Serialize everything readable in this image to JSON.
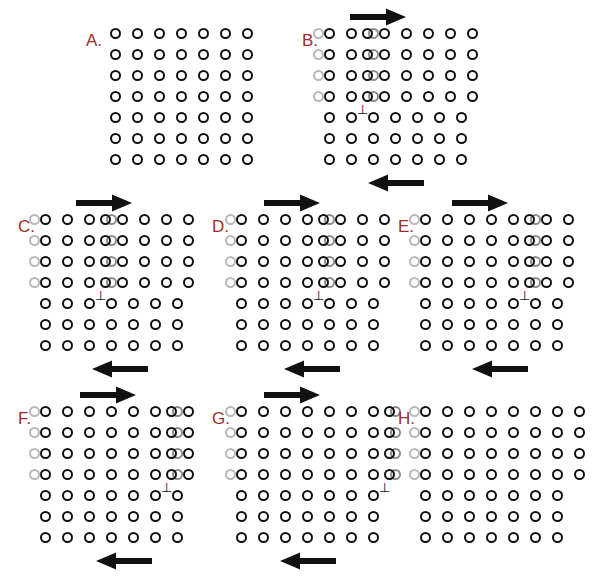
{
  "figure": {
    "background_color": "#ffffff",
    "label_color": "#9c2f26",
    "atom_color": "#111111",
    "ghost_color": "#b8b8b8",
    "arrow_color": "#111111",
    "grid": {
      "rows": 7,
      "cols": 7,
      "spacing_x": 22,
      "spacing_y": 21,
      "atom_diameter": 11
    }
  },
  "symbols": {
    "dislocation": "⊥",
    "arrow_right": "→",
    "arrow_left": "←"
  },
  "panels": [
    {
      "id": "A",
      "label": "A.",
      "x": 86,
      "y": 26,
      "label_x": 0,
      "label_y": 6,
      "origin_x": 24,
      "origin_y": 2,
      "rows": 7,
      "cols": 7,
      "shear_step": 0,
      "ghost_cols": 0,
      "shifted_rows": 0,
      "dislocation": null,
      "arrows": []
    },
    {
      "id": "B",
      "label": "B.",
      "x": 302,
      "y": 26,
      "label_x": 0,
      "label_y": 6,
      "origin_x": 22,
      "origin_y": 2,
      "rows": 7,
      "cols": 7,
      "shear_step": 1,
      "ghost_cols": 3,
      "shifted_rows": 4,
      "dislocation": {
        "col": 1,
        "row": 4
      },
      "arrows": [
        {
          "dir": "right",
          "x": 48,
          "y": -18,
          "length": 56
        },
        {
          "dir": "left",
          "x": 66,
          "y": 148,
          "length": 56
        }
      ]
    },
    {
      "id": "C",
      "label": "C.",
      "x": 18,
      "y": 212,
      "label_x": 0,
      "label_y": 6,
      "origin_x": 22,
      "origin_y": 2,
      "rows": 7,
      "cols": 7,
      "shear_step": 2,
      "ghost_cols": 4,
      "shifted_rows": 4,
      "dislocation": {
        "col": 2,
        "row": 4
      },
      "arrows": [
        {
          "dir": "right",
          "x": 58,
          "y": -18,
          "length": 56
        },
        {
          "dir": "left",
          "x": 74,
          "y": 148,
          "length": 56
        }
      ]
    },
    {
      "id": "D",
      "label": "D.",
      "x": 212,
      "y": 212,
      "label_x": 0,
      "label_y": 6,
      "origin_x": 24,
      "origin_y": 2,
      "rows": 7,
      "cols": 7,
      "shear_step": 3,
      "ghost_cols": 5,
      "shifted_rows": 4,
      "dislocation": {
        "col": 3,
        "row": 4
      },
      "arrows": [
        {
          "dir": "right",
          "x": 52,
          "y": -18,
          "length": 56
        },
        {
          "dir": "left",
          "x": 72,
          "y": 148,
          "length": 56
        }
      ]
    },
    {
      "id": "E",
      "label": "E.",
      "x": 398,
      "y": 212,
      "label_x": 0,
      "label_y": 6,
      "origin_x": 22,
      "origin_y": 2,
      "rows": 7,
      "cols": 7,
      "shear_step": 4,
      "ghost_cols": 6,
      "shifted_rows": 4,
      "dislocation": {
        "col": 4,
        "row": 4
      },
      "arrows": [
        {
          "dir": "right",
          "x": 54,
          "y": -18,
          "length": 56
        },
        {
          "dir": "left",
          "x": 74,
          "y": 148,
          "length": 56
        }
      ]
    },
    {
      "id": "F",
      "label": "F.",
      "x": 18,
      "y": 404,
      "label_x": 0,
      "label_y": 6,
      "origin_x": 22,
      "origin_y": 2,
      "rows": 7,
      "cols": 7,
      "shear_step": 5,
      "ghost_cols": 7,
      "shifted_rows": 4,
      "dislocation": {
        "col": 5,
        "row": 4
      },
      "arrows": [
        {
          "dir": "right",
          "x": 62,
          "y": -18,
          "length": 56
        },
        {
          "dir": "left",
          "x": 78,
          "y": 148,
          "length": 56
        }
      ]
    },
    {
      "id": "G",
      "label": "G.",
      "x": 212,
      "y": 404,
      "label_x": 0,
      "label_y": 6,
      "origin_x": 24,
      "origin_y": 2,
      "rows": 7,
      "cols": 7,
      "shear_step": 6,
      "ghost_cols": 7,
      "shifted_rows": 4,
      "dislocation": {
        "col": 6,
        "row": 4
      },
      "arrows": [
        {
          "dir": "right",
          "x": 52,
          "y": -18,
          "length": 56
        },
        {
          "dir": "left",
          "x": 68,
          "y": 148,
          "length": 56
        }
      ]
    },
    {
      "id": "H",
      "label": "H.",
      "x": 398,
      "y": 404,
      "label_x": 0,
      "label_y": 6,
      "origin_x": 22,
      "origin_y": 2,
      "rows": 7,
      "cols": 7,
      "shear_step": 7,
      "ghost_cols": 1,
      "shifted_rows": 4,
      "dislocation": null,
      "arrows": []
    }
  ]
}
